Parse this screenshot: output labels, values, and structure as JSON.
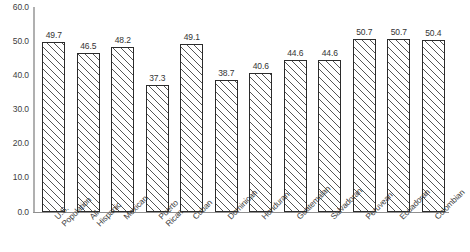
{
  "chart_data": {
    "type": "bar",
    "title": "",
    "subtitle": "",
    "xlabel": "",
    "ylabel": "",
    "ylim": [
      0.0,
      60.0
    ],
    "y_tick_labels": [
      "60.0",
      "50.0",
      "40.0",
      "30.0",
      "20.0",
      "10.0",
      "0.0"
    ],
    "y_tick_values": [
      60.0,
      50.0,
      40.0,
      30.0,
      20.0,
      10.0,
      0.0
    ],
    "grid": false,
    "legend": "none",
    "categories": [
      "U.S. Population",
      "All Hispanic",
      "Mexican",
      "Puerto Rican",
      "Cuban",
      "Dominican",
      "Honduran",
      "Guatemalan",
      "Salvadoran",
      "Peruvean",
      "Ecuadoran",
      "Colombian"
    ],
    "category_lines": [
      [
        "U.S.",
        "Population"
      ],
      [
        "All",
        "Hispanic"
      ],
      [
        "Mexican",
        ""
      ],
      [
        "Puerto",
        "Rican"
      ],
      [
        "Cuban",
        ""
      ],
      [
        "Dominican",
        ""
      ],
      [
        "Honduran",
        ""
      ],
      [
        "Guatemalan",
        ""
      ],
      [
        "Salvadoran",
        ""
      ],
      [
        "Peruvean",
        ""
      ],
      [
        "Ecuadoran",
        ""
      ],
      [
        "Colombian",
        ""
      ]
    ],
    "values": [
      49.7,
      46.5,
      48.2,
      37.3,
      49.1,
      38.7,
      40.6,
      44.6,
      44.6,
      50.7,
      50.7,
      50.4
    ],
    "value_labels": [
      "49.7",
      "46.5",
      "48.2",
      "37.3",
      "49.1",
      "38.7",
      "40.6",
      "44.6",
      "44.6",
      "50.7",
      "50.7",
      "50.4"
    ],
    "series": [
      {
        "name": "",
        "values": [
          49.7,
          46.5,
          48.2,
          37.3,
          49.1,
          38.7,
          40.6,
          44.6,
          44.6,
          50.7,
          50.7,
          50.4
        ]
      }
    ],
    "bar_style": {
      "fill": "diagonal-hatch",
      "border_color": "#2b2b2b",
      "hatch_color": "#555555",
      "background_color": "#ffffff"
    },
    "axis_color": "#8f8f8f"
  }
}
